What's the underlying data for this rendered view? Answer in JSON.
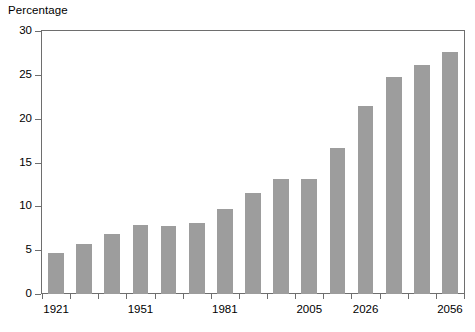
{
  "chart_data": {
    "type": "bar",
    "title": "",
    "subtitle": "",
    "ylabel": "Percentage",
    "xlabel": "",
    "ylim": [
      0,
      30
    ],
    "yticks": [
      0,
      5,
      10,
      15,
      20,
      25,
      30
    ],
    "ytick_labels": [
      "0",
      "5",
      "10",
      "15",
      "20",
      "25",
      "30"
    ],
    "grid": false,
    "legend": null,
    "bar_color": "#9d9d9d",
    "axis_color": "#6e6e6e",
    "text_color": "#000000",
    "background": "#ffffff",
    "categories": [
      "1921",
      "",
      "",
      "1951",
      "",
      "",
      "1981",
      "",
      "",
      "2005",
      "",
      "2026",
      "",
      "",
      "2056"
    ],
    "xtick_labels": [
      "1921",
      "1951",
      "1981",
      "2005",
      "2026",
      "2056"
    ],
    "xtick_label_indices": [
      0,
      3,
      6,
      9,
      11,
      14
    ],
    "values": [
      4.7,
      5.7,
      6.8,
      7.9,
      7.8,
      8.1,
      9.7,
      11.5,
      13.1,
      13.1,
      16.7,
      21.5,
      24.7,
      26.1,
      27.6
    ],
    "series": [
      {
        "name": "Percentage",
        "values": [
          4.7,
          5.7,
          6.8,
          7.9,
          7.8,
          8.1,
          9.7,
          11.5,
          13.1,
          13.1,
          16.7,
          21.5,
          24.7,
          26.1,
          27.6
        ]
      }
    ]
  }
}
